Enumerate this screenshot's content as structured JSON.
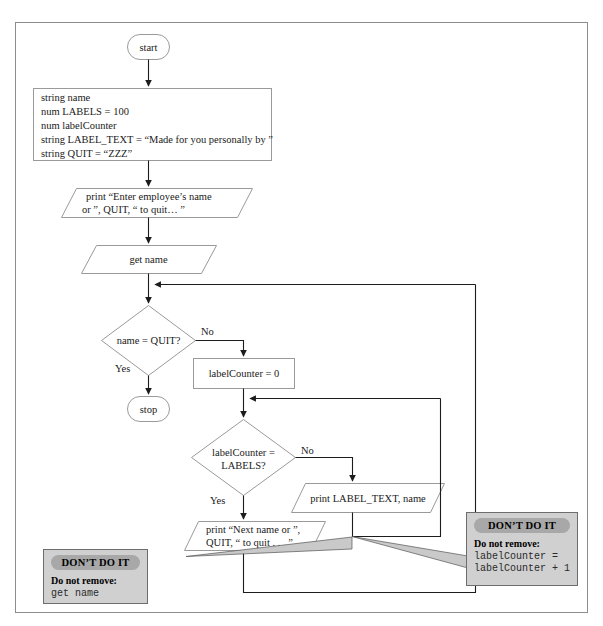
{
  "figure": {
    "type": "flowchart",
    "title": ""
  },
  "nodes": {
    "start": {
      "label": "start",
      "shape": "terminator"
    },
    "declarations": {
      "shape": "process",
      "lines": [
        "string name",
        "num LABELS = 100",
        "num labelCounter",
        "string LABEL_TEXT = “Made for you personally by ”",
        "string QUIT = “ZZZ”"
      ]
    },
    "prompt_print": {
      "shape": "input-output",
      "lines": [
        "print “Enter employee’s name",
        "or ”, QUIT, “ to quit… ”"
      ]
    },
    "get_name": {
      "shape": "input-output",
      "lines": [
        "get name"
      ]
    },
    "name_quit_decision": {
      "shape": "decision",
      "lines": [
        "name = QUIT?"
      ],
      "yes_label": "Yes",
      "no_label": "No"
    },
    "stop": {
      "label": "stop",
      "shape": "terminator"
    },
    "label_counter_init": {
      "shape": "process",
      "lines": [
        "labelCounter = 0"
      ]
    },
    "label_counter_decision": {
      "shape": "decision",
      "lines": [
        "labelCounter =",
        "LABELS?"
      ],
      "yes_label": "Yes",
      "no_label": "No"
    },
    "print_label": {
      "shape": "input-output",
      "lines": [
        "print LABEL_TEXT, name"
      ]
    },
    "next_name_print": {
      "shape": "input-output",
      "lines": [
        "print “Next name or ”,",
        "QUIT, “ to quit . . . ”"
      ]
    }
  },
  "callouts": {
    "left": {
      "badge": "DON’T DO IT",
      "label": "Do not remove:",
      "code": "get name"
    },
    "right": {
      "badge": "DON’T DO IT",
      "label": "Do not remove:",
      "code": "labelCounter =\nlabelCounter + 1"
    }
  },
  "colors": {
    "callout_bg": "#d0d0d0",
    "callout_badge": "#a8a8a8",
    "shape_stroke": "#9a9a9a",
    "connector": "#1c1c1c",
    "frame": "#8d8d8d"
  }
}
